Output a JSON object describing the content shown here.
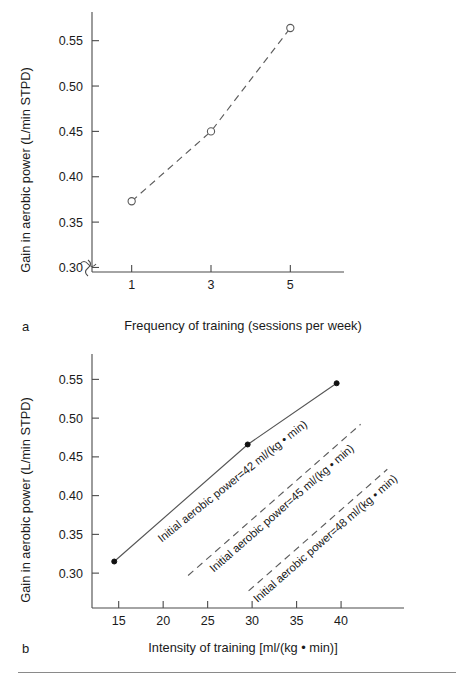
{
  "figure": {
    "bottom_rule": true,
    "colors": {
      "axis": "#4a4a4a",
      "line_dashed": "#5c5c5c",
      "line_solid": "#555555",
      "marker_fill": "#111111",
      "text": "#1a1a1a"
    }
  },
  "chart_data": [
    {
      "type": "line",
      "panel": "a",
      "title": "",
      "xlabel": "Frequency of training (sessions per week)",
      "ylabel": "Gain in aerobic power (L/min STPD)",
      "xlim": [
        0,
        6
      ],
      "ylim": [
        0.295,
        0.575
      ],
      "xticks": [
        1,
        3,
        5
      ],
      "xtick_labels": [
        "1",
        "3",
        "5"
      ],
      "yticks": [
        0.3,
        0.35,
        0.4,
        0.45,
        0.5,
        0.55
      ],
      "ytick_labels": [
        "0.30",
        "0.35",
        "0.40",
        "0.45",
        "0.50",
        "0.55"
      ],
      "grid": false,
      "legend": "none",
      "axis_break": true,
      "series": [
        {
          "name": "Gain vs frequency",
          "style": "dashed",
          "marker": "open-circle",
          "x": [
            1,
            3,
            5
          ],
          "values": [
            0.373,
            0.45,
            0.564
          ]
        }
      ]
    },
    {
      "type": "line",
      "panel": "b",
      "title": "",
      "xlabel": "Intensity of training [ml/(kg • min)]",
      "ylabel": "Gain in aerobic power (L/min STPD)",
      "xlim": [
        12.0,
        45.5
      ],
      "ylim": [
        0.255,
        0.575
      ],
      "xticks": [
        15,
        20,
        25,
        30,
        35,
        40
      ],
      "xtick_labels": [
        "15",
        "20",
        "25",
        "30",
        "35",
        "40"
      ],
      "yticks": [
        0.3,
        0.35,
        0.4,
        0.45,
        0.5,
        0.55
      ],
      "ytick_labels": [
        "0.30",
        "0.35",
        "0.40",
        "0.45",
        "0.50",
        "0.55"
      ],
      "grid": false,
      "legend": "inline-annotations",
      "series": [
        {
          "name": "Initial aerobic power=42 ml/(kg • min)",
          "style": "solid",
          "marker": "filled-circle",
          "x": [
            14.5,
            29.5,
            39.5
          ],
          "values": [
            0.315,
            0.466,
            0.545
          ],
          "annotation": "Initial aerobic power=42 ml/(kg • min)"
        },
        {
          "name": "Initial aerobic power=45 ml/(kg • min)",
          "style": "dashed",
          "marker": "none",
          "x": [
            22.8,
            42.2
          ],
          "values": [
            0.297,
            0.492
          ],
          "annotation": "Initial aerobic power=45 ml/(kg • min)"
        },
        {
          "name": "Initial aerobic power=48 ml/(kg • min)",
          "style": "dashed",
          "marker": "none",
          "x": [
            29.6,
            45.2
          ],
          "values": [
            0.277,
            0.434
          ],
          "annotation": "Initial aerobic power=48 ml/(kg • min)"
        }
      ]
    }
  ],
  "panels": {
    "a": {
      "letter": "a",
      "xlabel": "Frequency of training (sessions per week)",
      "ylabel": "Gain in aerobic power (L/min STPD)"
    },
    "b": {
      "letter": "b",
      "xlabel": "Intensity of training [ml/(kg • min)]",
      "ylabel": "Gain in aerobic power (L/min STPD)"
    }
  }
}
